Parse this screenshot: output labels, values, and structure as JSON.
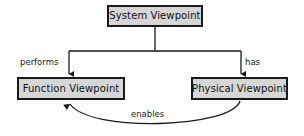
{
  "diagram": {
    "type": "node-link-diagram",
    "canvas": {
      "width": 304,
      "height": 136,
      "background_color": "#ffffff"
    },
    "style": {
      "node_fill": "#d6d6d6",
      "node_border": "#1a1a1a",
      "edge_color": "#1a1a1a",
      "text_color": "#111111"
    },
    "nodes": [
      {
        "id": "system",
        "label": "System Viewpoint",
        "x": 107,
        "y": 5,
        "width": 96,
        "height": 22
      },
      {
        "id": "function",
        "label": "Function Viewpoint",
        "x": 17,
        "y": 77,
        "width": 108,
        "height": 23
      },
      {
        "id": "physical",
        "label": "Physical Viewpoint",
        "x": 191,
        "y": 77,
        "width": 97,
        "height": 23
      }
    ],
    "edges": [
      {
        "id": "performs",
        "label": "performs",
        "from": "system",
        "to": "function",
        "shape": "orthogonal",
        "arrow": "end"
      },
      {
        "id": "has",
        "label": "has",
        "from": "system",
        "to": "physical",
        "shape": "orthogonal",
        "arrow": "end"
      },
      {
        "id": "enables",
        "label": "enables",
        "from": "physical",
        "to": "function",
        "shape": "curved",
        "arrow": "end"
      }
    ]
  }
}
